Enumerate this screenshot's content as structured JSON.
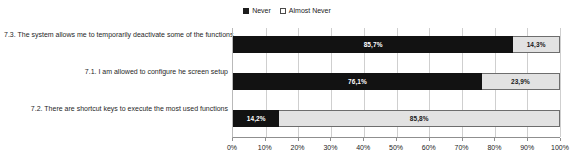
{
  "legend": {
    "position": "top-center",
    "entries": [
      {
        "label": "Never",
        "swatch": "filled-square-icon",
        "color": "#121212"
      },
      {
        "label": "Almost Never",
        "swatch": "open-square-icon",
        "color": "#e2e2e2"
      }
    ]
  },
  "chart_data": {
    "type": "bar",
    "orientation": "horizontal",
    "stacked": true,
    "stack_mode": "percent",
    "title": "",
    "subtitle": "",
    "xlabel": "",
    "ylabel": "",
    "xlim": [
      0,
      100
    ],
    "grid": true,
    "legend_position": "top-center",
    "categories": [
      "7.3. The system allows me to temporarily deactivate some of the functions",
      "7.1. I am allowed to configure he screen setup",
      "7.2. There are shortcut keys to execute the most used functions"
    ],
    "series": [
      {
        "name": "Never",
        "color": "#121212",
        "values": [
          85.7,
          76.1,
          14.2
        ],
        "labels": [
          "85,7%",
          "76,1%",
          "14,2%"
        ]
      },
      {
        "name": "Almost Never",
        "color": "#e2e2e2",
        "values": [
          14.3,
          23.9,
          85.8
        ],
        "labels": [
          "14,3%",
          "23,9%",
          "85,8%"
        ]
      }
    ],
    "xticks": [
      0,
      10,
      20,
      30,
      40,
      50,
      60,
      70,
      80,
      90,
      100
    ],
    "xticklabels": [
      "0%",
      "10%",
      "20%",
      "30%",
      "40%",
      "50%",
      "60%",
      "70%",
      "80%",
      "90%",
      "100%"
    ]
  }
}
